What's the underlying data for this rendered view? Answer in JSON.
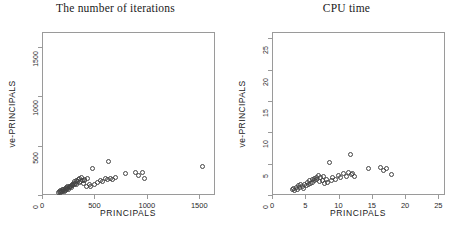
{
  "figure": {
    "background": "#ffffff",
    "point_style": "open-circle",
    "point_color": "#444444"
  },
  "chart_data": [
    {
      "type": "scatter",
      "title": "The number of iterations",
      "xlabel": "PRINCIPALS",
      "ylabel": "ve-PRINCIPALS",
      "xlim": [
        0,
        1650
      ],
      "ylim": [
        0,
        1650
      ],
      "xticks": [
        0,
        500,
        1000,
        1500
      ],
      "yticks": [
        0,
        500,
        1000,
        1500
      ],
      "grid": false,
      "legend": "none",
      "points": [
        [
          150,
          40
        ],
        [
          158,
          48
        ],
        [
          165,
          35
        ],
        [
          170,
          55
        ],
        [
          176,
          45
        ],
        [
          182,
          62
        ],
        [
          188,
          50
        ],
        [
          193,
          70
        ],
        [
          198,
          58
        ],
        [
          204,
          48
        ],
        [
          210,
          75
        ],
        [
          214,
          60
        ],
        [
          220,
          85
        ],
        [
          226,
          66
        ],
        [
          232,
          78
        ],
        [
          238,
          92
        ],
        [
          244,
          70
        ],
        [
          250,
          100
        ],
        [
          256,
          82
        ],
        [
          262,
          95
        ],
        [
          268,
          110
        ],
        [
          274,
          88
        ],
        [
          280,
          120
        ],
        [
          286,
          102
        ],
        [
          292,
          130
        ],
        [
          298,
          112
        ],
        [
          304,
          145
        ],
        [
          310,
          125
        ],
        [
          316,
          160
        ],
        [
          322,
          118
        ],
        [
          330,
          150
        ],
        [
          338,
          170
        ],
        [
          344,
          132
        ],
        [
          352,
          175
        ],
        [
          360,
          148
        ],
        [
          368,
          185
        ],
        [
          376,
          160
        ],
        [
          384,
          130
        ],
        [
          392,
          172
        ],
        [
          400,
          155
        ],
        [
          412,
          100
        ],
        [
          425,
          180
        ],
        [
          440,
          120
        ],
        [
          455,
          95
        ],
        [
          470,
          280
        ],
        [
          490,
          120
        ],
        [
          520,
          135
        ],
        [
          545,
          160
        ],
        [
          570,
          150
        ],
        [
          595,
          175
        ],
        [
          615,
          165
        ],
        [
          625,
          345
        ],
        [
          640,
          180
        ],
        [
          660,
          170
        ],
        [
          690,
          185
        ],
        [
          790,
          230
        ],
        [
          880,
          235
        ],
        [
          915,
          210
        ],
        [
          945,
          235
        ],
        [
          965,
          175
        ],
        [
          1520,
          300
        ]
      ]
    },
    {
      "type": "scatter",
      "title": "CPU time",
      "xlabel": "PRINCIPALS",
      "ylabel": "ve-PRINCIPALS",
      "xlim": [
        0,
        26
      ],
      "ylim": [
        0,
        26
      ],
      "xticks": [
        0,
        5,
        10,
        15,
        20,
        25
      ],
      "yticks": [
        0,
        5,
        10,
        15,
        20,
        25
      ],
      "grid": false,
      "legend": "none",
      "points": [
        [
          2.9,
          1.0
        ],
        [
          3.1,
          1.2
        ],
        [
          3.3,
          0.9
        ],
        [
          3.5,
          1.4
        ],
        [
          3.7,
          1.1
        ],
        [
          3.9,
          1.6
        ],
        [
          4.0,
          1.3
        ],
        [
          4.2,
          1.8
        ],
        [
          4.4,
          1.5
        ],
        [
          4.6,
          1.2
        ],
        [
          4.8,
          1.9
        ],
        [
          5.0,
          1.6
        ],
        [
          5.2,
          2.2
        ],
        [
          5.3,
          1.8
        ],
        [
          5.5,
          2.4
        ],
        [
          5.7,
          2.0
        ],
        [
          5.9,
          2.6
        ],
        [
          6.0,
          2.2
        ],
        [
          6.2,
          2.8
        ],
        [
          6.3,
          2.4
        ],
        [
          6.5,
          3.0
        ],
        [
          6.6,
          2.6
        ],
        [
          6.8,
          3.2
        ],
        [
          7.0,
          2.3
        ],
        [
          7.2,
          2.9
        ],
        [
          7.4,
          2.5
        ],
        [
          7.6,
          3.1
        ],
        [
          7.8,
          2.0
        ],
        [
          8.0,
          2.7
        ],
        [
          8.2,
          2.2
        ],
        [
          8.5,
          5.3
        ],
        [
          8.8,
          2.4
        ],
        [
          9.0,
          3.0
        ],
        [
          9.4,
          2.6
        ],
        [
          9.8,
          3.3
        ],
        [
          10.2,
          2.9
        ],
        [
          10.6,
          3.6
        ],
        [
          11.0,
          3.1
        ],
        [
          11.4,
          3.8
        ],
        [
          11.6,
          6.6
        ],
        [
          11.8,
          3.4
        ],
        [
          12.0,
          3.6
        ],
        [
          12.2,
          3.1
        ],
        [
          14.3,
          4.4
        ],
        [
          16.2,
          4.6
        ],
        [
          16.6,
          4.0
        ],
        [
          17.0,
          4.4
        ],
        [
          17.8,
          3.5
        ]
      ]
    }
  ]
}
